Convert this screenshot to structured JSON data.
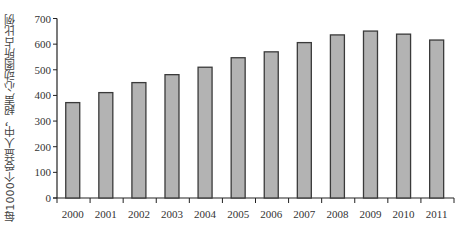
{
  "chart_data": {
    "type": "bar",
    "title": "",
    "xlabel": "",
    "ylabel": "每1000个受益人中，超声心动图所占比例",
    "categories": [
      "2000",
      "2001",
      "2002",
      "2003",
      "2004",
      "2005",
      "2006",
      "2007",
      "2008",
      "2009",
      "2010",
      "2011"
    ],
    "values": [
      372,
      411,
      450,
      481,
      510,
      547,
      570,
      606,
      636,
      651,
      639,
      616
    ],
    "ylim": [
      0,
      700
    ],
    "yticks": [
      0,
      100,
      200,
      300,
      400,
      500,
      600,
      700
    ],
    "grid": false,
    "legend": null,
    "colors": {
      "bar_fill": "#b3b3b3",
      "bar_stroke": "#3a3a3a",
      "axis": "#222222"
    }
  }
}
